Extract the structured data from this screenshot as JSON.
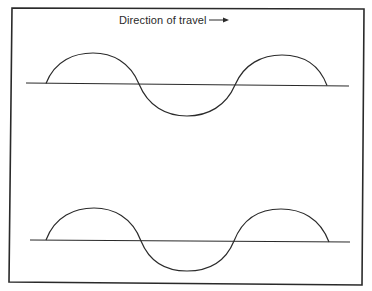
{
  "diagram": {
    "caption": "Direction of travel",
    "arrow_icon": "right-arrow-icon",
    "line_color": "#2a2a2a",
    "background": "#ffffff",
    "frame": {
      "x1": 12,
      "y1": 8,
      "x2": 364,
      "y2": 285
    },
    "waves": [
      {
        "name": "top-wave",
        "axis": {
          "x1": 26,
          "y1": 83,
          "x2": 349,
          "y2": 86
        },
        "crest1": {
          "x_start": 46,
          "x_end": 139,
          "peak_y": 53
        },
        "trough": {
          "x_start": 139,
          "x_end": 235,
          "bottom_y": 116
        },
        "crest2": {
          "x_start": 235,
          "x_end": 327,
          "peak_y": 55
        }
      },
      {
        "name": "bottom-wave",
        "axis": {
          "x1": 30,
          "y1": 240,
          "x2": 350,
          "y2": 242
        },
        "crest1": {
          "x_start": 46,
          "x_end": 141,
          "peak_y": 208
        },
        "trough": {
          "x_start": 141,
          "x_end": 234,
          "bottom_y": 271
        },
        "crest2": {
          "x_start": 234,
          "x_end": 329,
          "peak_y": 209
        }
      }
    ]
  }
}
